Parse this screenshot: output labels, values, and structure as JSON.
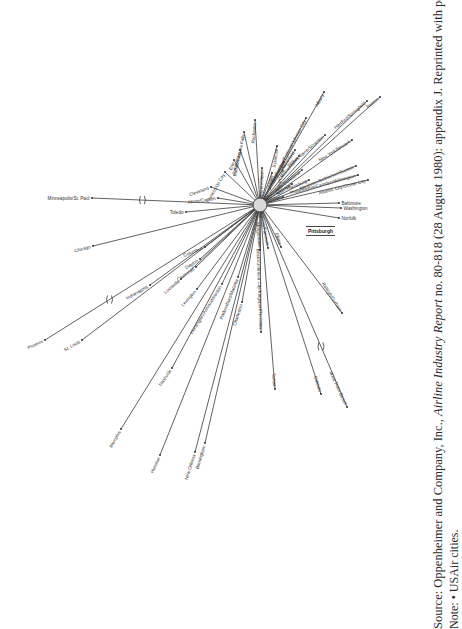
{
  "diagram": {
    "hub": {
      "label": "Pittsburgh",
      "x": 260,
      "y": 205,
      "r": 7
    },
    "spokes": [
      {
        "city": "Minneapolis/St. Paul",
        "x": 92,
        "y": 198,
        "angle": 0,
        "anchor": "end",
        "break": true
      },
      {
        "city": "Akron/Canton",
        "x": 218,
        "y": 198,
        "angle": 8,
        "anchor": "end"
      },
      {
        "city": "Toledo",
        "x": 186,
        "y": 212,
        "angle": 0,
        "anchor": "end"
      },
      {
        "city": "Cleveland",
        "x": 211,
        "y": 187,
        "angle": 20,
        "anchor": "end"
      },
      {
        "city": "Franklin/Oil City",
        "x": 225,
        "y": 172,
        "angle": 60,
        "anchor": "end"
      },
      {
        "city": "Erie",
        "x": 234,
        "y": 160,
        "angle": 70,
        "anchor": "end"
      },
      {
        "city": "Jamestown",
        "x": 240,
        "y": 150,
        "angle": 75,
        "anchor": "end"
      },
      {
        "city": "Buffalo/Niagara Falls",
        "x": 244,
        "y": 132,
        "angle": 78,
        "anchor": "end"
      },
      {
        "city": "Rochester",
        "x": 255,
        "y": 120,
        "angle": 85,
        "anchor": "end"
      },
      {
        "city": "Bradford/Warren/Olean",
        "x": 262,
        "y": 168,
        "angle": 88,
        "anchor": "end"
      },
      {
        "city": "DuBois",
        "x": 272,
        "y": 173,
        "angle": 80,
        "anchor": "end"
      },
      {
        "city": "Syracuse",
        "x": 277,
        "y": 146,
        "angle": 82,
        "anchor": "end"
      },
      {
        "city": "Elmira/Corning",
        "x": 284,
        "y": 162,
        "angle": 78,
        "anchor": "end"
      },
      {
        "city": "Binghamton/Endicott/Johnson City",
        "x": 306,
        "y": 118,
        "angle": 62,
        "anchor": "end"
      },
      {
        "city": "Albany",
        "x": 324,
        "y": 92,
        "angle": 62,
        "anchor": "end"
      },
      {
        "city": "Philipsburg/Clearfield",
        "x": 295,
        "y": 150,
        "angle": 55,
        "anchor": "end"
      },
      {
        "city": "Williamsport",
        "x": 299,
        "y": 156,
        "angle": 50,
        "anchor": "end"
      },
      {
        "city": "Wilkes Barre/Scranton",
        "x": 325,
        "y": 135,
        "angle": 40,
        "anchor": "end"
      },
      {
        "city": "Hartford/Springfield",
        "x": 367,
        "y": 101,
        "angle": 40,
        "anchor": "end"
      },
      {
        "city": "Boston",
        "x": 380,
        "y": 97,
        "angle": 38,
        "anchor": "end"
      },
      {
        "city": "State College/Bellefonte",
        "x": 302,
        "y": 170,
        "angle": 38,
        "anchor": "end"
      },
      {
        "city": "New York/Newark",
        "x": 352,
        "y": 140,
        "angle": 32,
        "anchor": "end"
      },
      {
        "city": "Altoona",
        "x": 292,
        "y": 184,
        "angle": 35,
        "anchor": "end"
      },
      {
        "city": "Harrisburg",
        "x": 309,
        "y": 180,
        "angle": 22,
        "anchor": "end"
      },
      {
        "city": "Allentown/Bethlehem/Easton",
        "x": 356,
        "y": 166,
        "angle": 22,
        "anchor": "end"
      },
      {
        "city": "Philadelphia/Camden/Wilmington",
        "x": 358,
        "y": 175,
        "angle": 15,
        "anchor": "end"
      },
      {
        "city": "Atlantic City/Ocean City",
        "x": 368,
        "y": 180,
        "angle": 15,
        "anchor": "end"
      },
      {
        "city": "Johnstown",
        "x": 283,
        "y": 197,
        "angle": 8,
        "anchor": "end"
      },
      {
        "city": "Baltimore",
        "x": 339,
        "y": 203,
        "angle": 0,
        "anchor": "start"
      },
      {
        "city": "Washington",
        "x": 341,
        "y": 208,
        "angle": 0,
        "anchor": "start"
      },
      {
        "city": "Norfolk",
        "x": 339,
        "y": 218,
        "angle": 0,
        "anchor": "start"
      },
      {
        "city": "Morgantown",
        "x": 260,
        "y": 250,
        "angle": -85,
        "anchor": "end"
      },
      {
        "city": "Clarksburg/Fairmont",
        "x": 268,
        "y": 248,
        "angle": -80,
        "anchor": "end"
      },
      {
        "city": "Elkins",
        "x": 281,
        "y": 247,
        "angle": -72,
        "anchor": "end"
      },
      {
        "city": "Raleigh/Durham",
        "x": 342,
        "y": 313,
        "angle": -58,
        "anchor": "end"
      },
      {
        "city": "Bristol/Johnson City/Kingsport/Tri-Cities",
        "x": 261,
        "y": 332,
        "angle": -88,
        "anchor": "end"
      },
      {
        "city": "Tampa",
        "x": 275,
        "y": 389,
        "angle": -85,
        "anchor": "end"
      },
      {
        "city": "Orlando",
        "x": 321,
        "y": 394,
        "angle": -72,
        "anchor": "end"
      },
      {
        "city": "West Palm Beach",
        "x": 347,
        "y": 407,
        "angle": -65,
        "anchor": "end",
        "break": true
      },
      {
        "city": "Columbus",
        "x": 205,
        "y": 247,
        "angle": 22,
        "anchor": "end"
      },
      {
        "city": "Dayton",
        "x": 200,
        "y": 259,
        "angle": 32,
        "anchor": "end"
      },
      {
        "city": "Cincinnati",
        "x": 196,
        "y": 267,
        "angle": 35,
        "anchor": "end"
      },
      {
        "city": "Louisville",
        "x": 181,
        "y": 279,
        "angle": 40,
        "anchor": "end"
      },
      {
        "city": "Lexington",
        "x": 197,
        "y": 289,
        "angle": 48,
        "anchor": "end"
      },
      {
        "city": "Huntington/Ashland/Ironton",
        "x": 222,
        "y": 284,
        "angle": 58,
        "anchor": "end"
      },
      {
        "city": "Parkersburg/Marietta",
        "x": 238,
        "y": 277,
        "angle": 68,
        "anchor": "end"
      },
      {
        "city": "Charleston",
        "x": 242,
        "y": 302,
        "angle": 72,
        "anchor": "end"
      },
      {
        "city": "Indianapolis",
        "x": 150,
        "y": 285,
        "angle": 30,
        "anchor": "end"
      },
      {
        "city": "Chicago",
        "x": 93,
        "y": 246,
        "angle": 15,
        "anchor": "end"
      },
      {
        "city": "St. Louis",
        "x": 82,
        "y": 340,
        "angle": 30,
        "anchor": "end"
      },
      {
        "city": "Phoenix",
        "x": 45,
        "y": 340,
        "angle": 25,
        "anchor": "end",
        "break": true
      },
      {
        "city": "Nashville",
        "x": 172,
        "y": 368,
        "angle": 55,
        "anchor": "end"
      },
      {
        "city": "Memphis",
        "x": 121,
        "y": 429,
        "angle": 60,
        "anchor": "end"
      },
      {
        "city": "Houston",
        "x": 160,
        "y": 455,
        "angle": 65,
        "anchor": "end"
      },
      {
        "city": "New Orleans",
        "x": 195,
        "y": 452,
        "angle": 72,
        "anchor": "end"
      },
      {
        "city": "Birmingham",
        "x": 205,
        "y": 443,
        "angle": 73,
        "anchor": "end"
      }
    ]
  },
  "caption": {
    "source_prefix": "Source: Oppenheimer and Company, Inc., ",
    "source_italic": "Airline Industry Report",
    "source_suffix": " no. 80-818 (28 August 1980): appendix J. Reprinted with permission.",
    "note": "Note: • USAir cities."
  }
}
